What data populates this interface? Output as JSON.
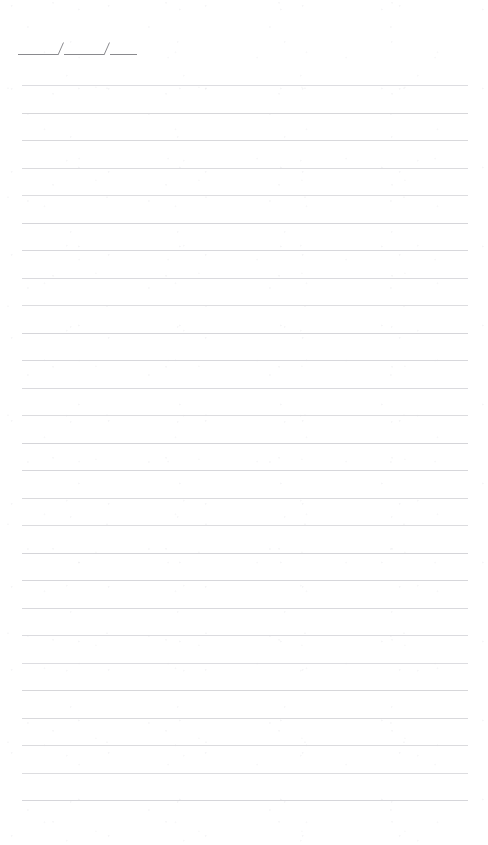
{
  "page": {
    "width": 488,
    "height": 845,
    "background_color": "#ffffff"
  },
  "date_field": {
    "name": "date-field",
    "pattern": "___/___/___",
    "separator": "/",
    "segment_labels": [
      "day-blank",
      "month-blank",
      "year-blank"
    ],
    "stroke_color": "#8a8a8e",
    "stroke_width": 1,
    "left": 18,
    "baseline_y": 53,
    "total_width": 119,
    "segments": [
      {
        "name": "date-segment-1",
        "width": 40
      },
      {
        "name": "date-segment-2",
        "width": 40
      },
      {
        "name": "date-segment-3",
        "width": 27
      }
    ],
    "slashes": [
      {
        "name": "date-slash-1",
        "x": 60,
        "height": 12,
        "lean": 4
      },
      {
        "name": "date-slash-2",
        "x": 103,
        "height": 12,
        "lean": 4
      }
    ]
  },
  "ruled_area": {
    "name": "ruled-lines",
    "line_color": "#d5d5d9",
    "line_width": 1,
    "left": 22,
    "right": 468,
    "line_length": 446,
    "spacing": 27.5,
    "first_line_y": 85,
    "last_line_y": 800,
    "line_count": 27,
    "line_positions": [
      85,
      112.5,
      140,
      167.5,
      195,
      222.5,
      250,
      277.5,
      305,
      332.5,
      360,
      387.5,
      415,
      442.5,
      470,
      497.5,
      525,
      552.5,
      580,
      607.5,
      635,
      662.5,
      690,
      717.5,
      745,
      772.5,
      800
    ]
  },
  "margins": {
    "top_blank_height": 38,
    "bottom_blank_height": 45
  }
}
